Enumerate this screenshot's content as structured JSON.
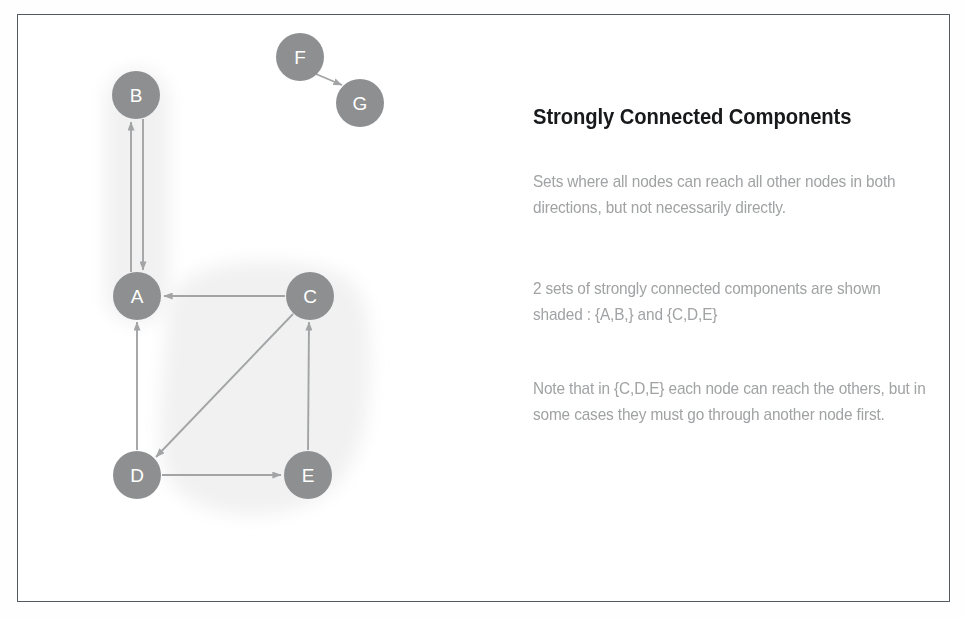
{
  "figure": {
    "border_color": "#555a5e",
    "background": "#ffffff"
  },
  "panel": {
    "title": "Strongly Connected Components",
    "paragraphs": [
      "Sets where all nodes can reach all other nodes in both directions, but not necessarily directly.",
      "2 sets of strongly connected components are shown shaded : {A,B,} and {C,D,E}",
      "Note that in {C,D,E} each node can reach the others, but in some cases they must go through another node first."
    ],
    "title_color": "#17191b",
    "body_color": "#a0a2a3"
  },
  "graph": {
    "node_fill": "#8d8f90",
    "node_label_color": "#ffffff",
    "edge_color": "#a2a4a5",
    "shade_color": "#f2f2f2",
    "nodes": [
      {
        "id": "B",
        "label": "B",
        "cx": 119,
        "cy": 81,
        "r": 24
      },
      {
        "id": "F",
        "label": "F",
        "cx": 283,
        "cy": 43,
        "r": 24
      },
      {
        "id": "G",
        "label": "G",
        "cx": 343,
        "cy": 89,
        "r": 24
      },
      {
        "id": "A",
        "label": "A",
        "cx": 120,
        "cy": 282,
        "r": 24
      },
      {
        "id": "C",
        "label": "C",
        "cx": 293,
        "cy": 282,
        "r": 24
      },
      {
        "id": "D",
        "label": "D",
        "cx": 120,
        "cy": 461,
        "r": 24
      },
      {
        "id": "E",
        "label": "E",
        "cx": 291,
        "cy": 461,
        "r": 24
      }
    ],
    "edges": [
      {
        "from": "B",
        "to": "A",
        "kind": "parallel-down"
      },
      {
        "from": "A",
        "to": "B",
        "kind": "parallel-up"
      },
      {
        "from": "C",
        "to": "A",
        "kind": "straight"
      },
      {
        "from": "C",
        "to": "D",
        "kind": "diagonal"
      },
      {
        "from": "D",
        "to": "A",
        "kind": "straight"
      },
      {
        "from": "D",
        "to": "E",
        "kind": "straight"
      },
      {
        "from": "E",
        "to": "C",
        "kind": "straight"
      },
      {
        "from": "F",
        "to": "G",
        "kind": "diagonal"
      }
    ],
    "shaded_components": [
      {
        "name": "component-ab",
        "members": [
          "A",
          "B"
        ]
      },
      {
        "name": "component-cde",
        "members": [
          "C",
          "D",
          "E"
        ]
      }
    ]
  }
}
